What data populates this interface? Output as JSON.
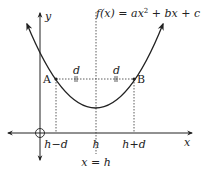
{
  "function_label": {
    "text": "f(x) = ax",
    "sup": "2",
    "rest": " + bx + c"
  },
  "axes": {
    "x_label": "x",
    "y_label": "y"
  },
  "points": {
    "A": "A",
    "B": "B"
  },
  "distance_labels": {
    "left": "d",
    "right": "d"
  },
  "x_ticks": {
    "left": "h−d",
    "center": "h",
    "right": "h+d"
  },
  "axis_of_symmetry_label": "x = h",
  "colors": {
    "stroke": "#222222",
    "background": "#ffffff"
  }
}
